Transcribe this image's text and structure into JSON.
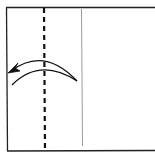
{
  "diagram": {
    "type": "origami-fold-step",
    "colors": {
      "background": "#ffffff",
      "paper_edge": "#222222",
      "valley_line": "#111111",
      "crease_line": "#9a9a9a",
      "arrow": "#111111"
    },
    "elements": {
      "paper_edges": "Open rectangle: left, top and bottom edges (right side extends beyond frame)",
      "valley_fold_line": "Vertical dashed line",
      "existing_crease": "Thin gray vertical line",
      "fold_arrow": "Curved crescent arrow pointing left"
    }
  }
}
